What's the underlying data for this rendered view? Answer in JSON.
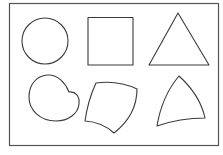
{
  "diagram": {
    "title": "",
    "background": "#ffffff",
    "stroke_color": "#3a3a3a",
    "frame": {
      "x": 9.5,
      "y": 3.5,
      "w": 209,
      "h": 142
    },
    "shapes": [
      {
        "id": "circle",
        "row": 1,
        "col": 1,
        "kind": "circle",
        "label": ""
      },
      {
        "id": "square",
        "row": 1,
        "col": 2,
        "kind": "square",
        "label": ""
      },
      {
        "id": "triangle",
        "row": 1,
        "col": 3,
        "kind": "triangle",
        "label": ""
      },
      {
        "id": "bean",
        "row": 2,
        "col": 1,
        "kind": "deformed-circle",
        "label": ""
      },
      {
        "id": "curved-quad",
        "row": 2,
        "col": 2,
        "kind": "deformed-square",
        "label": ""
      },
      {
        "id": "curved-triangle",
        "row": 2,
        "col": 3,
        "kind": "deformed-triangle",
        "label": ""
      }
    ]
  }
}
